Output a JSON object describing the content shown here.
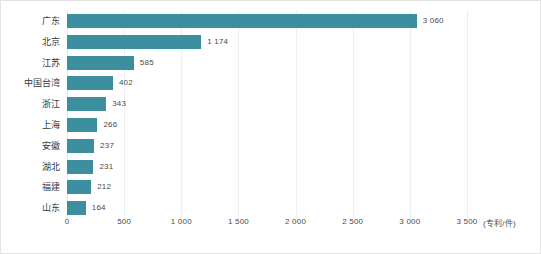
{
  "chart_data": {
    "type": "bar",
    "orientation": "horizontal",
    "title": "",
    "subtitle": "",
    "xlabel": "",
    "ylabel": "",
    "axis_unit_label": "(专利/件)",
    "categories": [
      "广东",
      "北京",
      "江苏",
      "中国台湾",
      "浙江",
      "上海",
      "安徽",
      "湖北",
      "福建",
      "山东"
    ],
    "values": [
      3060,
      1174,
      585,
      402,
      343,
      266,
      237,
      231,
      212,
      164
    ],
    "value_labels": [
      "3 060",
      "1 174",
      "585",
      "402",
      "343",
      "266",
      "237",
      "231",
      "212",
      "164"
    ],
    "xlim": [
      0,
      3500
    ],
    "xticks": [
      0,
      500,
      1000,
      1500,
      2000,
      2500,
      3000,
      3500
    ],
    "xtick_labels": [
      "0",
      "500",
      "1 000",
      "1 500",
      "2 000",
      "2 500",
      "3 000",
      "3 500"
    ],
    "grid": true,
    "grid_axis": "x",
    "legend": false,
    "legend_position": "none",
    "bar_color": "#3d8fa0",
    "gridline_color": "#eceff0",
    "text_color": "#4a4a4a",
    "frame_color": "#e3e3e3",
    "background_color": "#ffffff"
  }
}
